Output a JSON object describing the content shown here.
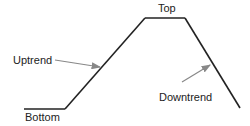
{
  "diagram": {
    "title": "",
    "labels": {
      "top": "Top",
      "bottom": "Bottom",
      "uptrend": "Uptrend",
      "downtrend": "Downtrend"
    },
    "colors": {
      "line": "#222222",
      "arrow": "#888888",
      "text": "#222222"
    },
    "phases": [
      "Bottom",
      "Uptrend",
      "Top",
      "Downtrend"
    ]
  }
}
